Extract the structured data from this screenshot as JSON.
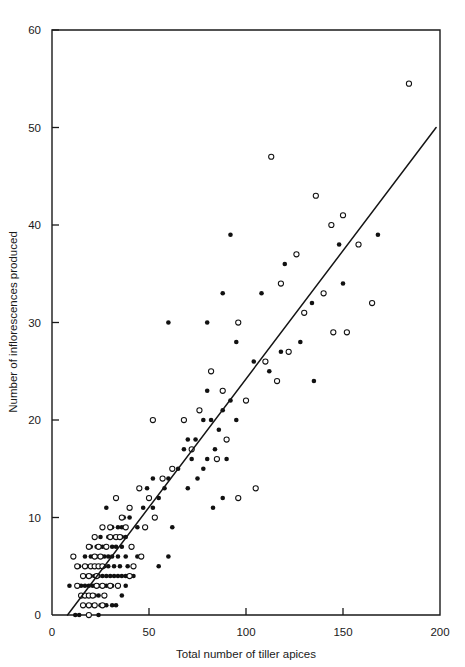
{
  "chart_data": {
    "type": "scatter",
    "title": "",
    "xlabel": "Total number of tiller apices",
    "ylabel": "Number of inflorescences produced",
    "xlim": [
      0,
      200
    ],
    "ylim": [
      0,
      60
    ],
    "xticks": [
      0,
      50,
      100,
      150,
      200
    ],
    "yticks": [
      0,
      10,
      20,
      30,
      40,
      50,
      60
    ],
    "xtick_labels": [
      "0",
      "50",
      "100",
      "150",
      "200"
    ],
    "ytick_labels": [
      "0",
      "10",
      "20",
      "30",
      "40",
      "50",
      "60"
    ],
    "grid": false,
    "legend_position": "none",
    "annotations": [],
    "fit_line": {
      "name": "regression line",
      "style": "solid",
      "x0": 8,
      "y0": 0,
      "x1": 198,
      "y1": 50
    },
    "series": [
      {
        "name": "filled circles",
        "marker": "filled-circle",
        "color": "#111111",
        "points": [
          [
            12,
            0
          ],
          [
            14,
            0
          ],
          [
            24,
            0
          ],
          [
            21,
            1
          ],
          [
            25,
            1
          ],
          [
            28,
            1
          ],
          [
            31,
            1
          ],
          [
            33,
            1
          ],
          [
            18,
            2
          ],
          [
            20,
            2
          ],
          [
            22,
            2
          ],
          [
            24,
            2
          ],
          [
            36,
            2
          ],
          [
            9,
            3
          ],
          [
            15,
            3
          ],
          [
            17,
            3
          ],
          [
            19,
            3
          ],
          [
            21,
            3
          ],
          [
            24,
            3
          ],
          [
            28,
            3
          ],
          [
            31,
            3
          ],
          [
            38,
            3
          ],
          [
            18,
            4
          ],
          [
            20,
            4
          ],
          [
            22,
            4
          ],
          [
            24,
            4
          ],
          [
            26,
            4
          ],
          [
            28,
            4
          ],
          [
            30,
            4
          ],
          [
            32,
            4
          ],
          [
            34,
            4
          ],
          [
            36,
            4
          ],
          [
            38,
            4
          ],
          [
            42,
            4
          ],
          [
            14,
            5
          ],
          [
            18,
            5
          ],
          [
            21,
            5
          ],
          [
            23,
            5
          ],
          [
            25,
            5
          ],
          [
            27,
            5
          ],
          [
            29,
            5
          ],
          [
            32,
            5
          ],
          [
            35,
            5
          ],
          [
            39,
            5
          ],
          [
            55,
            5
          ],
          [
            17,
            6
          ],
          [
            20,
            6
          ],
          [
            23,
            6
          ],
          [
            25,
            6
          ],
          [
            27,
            6
          ],
          [
            29,
            6
          ],
          [
            31,
            6
          ],
          [
            34,
            6
          ],
          [
            38,
            6
          ],
          [
            44,
            6
          ],
          [
            60,
            6
          ],
          [
            20,
            7
          ],
          [
            23,
            7
          ],
          [
            26,
            7
          ],
          [
            28,
            7
          ],
          [
            31,
            7
          ],
          [
            33,
            7
          ],
          [
            36,
            7
          ],
          [
            25,
            8
          ],
          [
            29,
            8
          ],
          [
            32,
            8
          ],
          [
            34,
            8
          ],
          [
            36,
            8
          ],
          [
            38,
            8
          ],
          [
            31,
            9
          ],
          [
            34,
            9
          ],
          [
            36,
            9
          ],
          [
            44,
            9
          ],
          [
            62,
            9
          ],
          [
            37,
            10
          ],
          [
            40,
            10
          ],
          [
            28,
            11
          ],
          [
            47,
            11
          ],
          [
            52,
            11
          ],
          [
            83,
            11
          ],
          [
            55,
            12
          ],
          [
            88,
            12
          ],
          [
            49,
            13
          ],
          [
            58,
            13
          ],
          [
            70,
            13
          ],
          [
            52,
            14
          ],
          [
            60,
            14
          ],
          [
            75,
            14
          ],
          [
            65,
            15
          ],
          [
            78,
            15
          ],
          [
            72,
            16
          ],
          [
            80,
            16
          ],
          [
            90,
            16
          ],
          [
            68,
            17
          ],
          [
            84,
            17
          ],
          [
            70,
            18
          ],
          [
            74,
            18
          ],
          [
            86,
            19
          ],
          [
            78,
            20
          ],
          [
            82,
            20
          ],
          [
            95,
            20
          ],
          [
            88,
            21
          ],
          [
            92,
            22
          ],
          [
            100,
            22
          ],
          [
            80,
            23
          ],
          [
            135,
            24
          ],
          [
            112,
            25
          ],
          [
            104,
            26
          ],
          [
            118,
            27
          ],
          [
            95,
            28
          ],
          [
            128,
            28
          ],
          [
            60,
            30
          ],
          [
            80,
            30
          ],
          [
            134,
            32
          ],
          [
            88,
            33
          ],
          [
            108,
            33
          ],
          [
            150,
            34
          ],
          [
            120,
            36
          ],
          [
            148,
            38
          ],
          [
            168,
            39
          ],
          [
            92,
            39
          ]
        ]
      },
      {
        "name": "open circles",
        "marker": "open-circle",
        "color": "#ffffff",
        "points": [
          [
            19,
            0
          ],
          [
            16,
            1
          ],
          [
            19,
            1
          ],
          [
            22,
            1
          ],
          [
            26,
            1
          ],
          [
            15,
            2
          ],
          [
            17,
            2
          ],
          [
            19,
            2
          ],
          [
            21,
            2
          ],
          [
            27,
            2
          ],
          [
            13,
            3
          ],
          [
            23,
            3
          ],
          [
            26,
            3
          ],
          [
            30,
            3
          ],
          [
            34,
            3
          ],
          [
            16,
            4
          ],
          [
            19,
            4
          ],
          [
            23,
            4
          ],
          [
            40,
            4
          ],
          [
            13,
            5
          ],
          [
            17,
            5
          ],
          [
            20,
            5
          ],
          [
            22,
            5
          ],
          [
            24,
            5
          ],
          [
            26,
            5
          ],
          [
            42,
            5
          ],
          [
            11,
            6
          ],
          [
            22,
            6
          ],
          [
            25,
            6
          ],
          [
            46,
            6
          ],
          [
            19,
            7
          ],
          [
            24,
            7
          ],
          [
            28,
            7
          ],
          [
            41,
            7
          ],
          [
            22,
            8
          ],
          [
            30,
            8
          ],
          [
            33,
            8
          ],
          [
            35,
            8
          ],
          [
            26,
            9
          ],
          [
            30,
            9
          ],
          [
            38,
            9
          ],
          [
            48,
            9
          ],
          [
            36,
            10
          ],
          [
            53,
            10
          ],
          [
            40,
            11
          ],
          [
            33,
            12
          ],
          [
            50,
            12
          ],
          [
            96,
            12
          ],
          [
            45,
            13
          ],
          [
            105,
            13
          ],
          [
            57,
            14
          ],
          [
            62,
            15
          ],
          [
            85,
            16
          ],
          [
            72,
            17
          ],
          [
            90,
            18
          ],
          [
            52,
            20
          ],
          [
            68,
            20
          ],
          [
            76,
            21
          ],
          [
            100,
            22
          ],
          [
            88,
            23
          ],
          [
            116,
            24
          ],
          [
            82,
            25
          ],
          [
            110,
            26
          ],
          [
            122,
            27
          ],
          [
            145,
            29
          ],
          [
            152,
            29
          ],
          [
            96,
            30
          ],
          [
            130,
            31
          ],
          [
            165,
            32
          ],
          [
            140,
            33
          ],
          [
            118,
            34
          ],
          [
            126,
            37
          ],
          [
            158,
            38
          ],
          [
            144,
            40
          ],
          [
            150,
            41
          ],
          [
            136,
            43
          ],
          [
            113,
            47
          ],
          [
            184,
            54.5
          ]
        ]
      }
    ]
  }
}
